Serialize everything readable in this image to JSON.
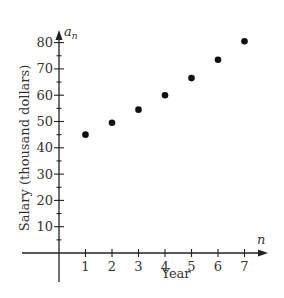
{
  "chart_data": {
    "type": "scatter",
    "title": "",
    "xlabel": "Year",
    "ylabel": "Salary (thousand dollars)",
    "x_axis_variable": "n",
    "y_axis_variable": "a_n",
    "x": [
      1,
      2,
      3,
      4,
      5,
      6,
      7
    ],
    "series": [
      {
        "name": "a_n",
        "values": [
          45,
          49.5,
          54.5,
          60,
          66.5,
          73.5,
          80.5
        ]
      }
    ],
    "x_ticks": [
      "1",
      "2",
      "3",
      "4",
      "5",
      "6",
      "7"
    ],
    "y_ticks": [
      "10",
      "20",
      "30",
      "40",
      "50",
      "60",
      "70",
      "80"
    ],
    "xlim": [
      0,
      7.8
    ],
    "ylim": [
      0,
      84
    ],
    "grid": false,
    "legend": "none",
    "minor_y_tick_step": 5
  },
  "labels": {
    "x_title": "Year",
    "y_title": "Salary (thousand dollars)",
    "x_var": "n",
    "y_var_base": "a",
    "y_var_sub": "n"
  },
  "colors": {
    "axis": "#222222",
    "points": "#111111",
    "text": "#333333"
  }
}
